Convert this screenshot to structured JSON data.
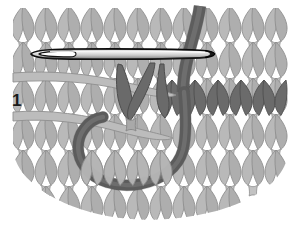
{
  "illustration": {
    "title": "Grafting with tapestry needle on stockinette knitting",
    "step_label": "1",
    "subject": "knitting-technique-diagram",
    "caption_text": "1"
  },
  "palette": {
    "background": "#ffffff",
    "fabric_light": "#b9b9b9",
    "fabric_light_shade": "#a8a8a8",
    "fabric_outline": "#8e8e8e",
    "fabric_highlight": "#cfcfcf",
    "yarn_dark": "#6b6b6b",
    "yarn_dark_shade": "#5c5c5c",
    "yarn_dark_outline": "#4a4a4a",
    "needle_body": "#d8d8d8",
    "needle_outline": "#111111",
    "label_color": "#1b1b1b"
  },
  "elements": {
    "knit_fabric_label": "knitted stockinette fabric",
    "needle_label": "tapestry needle",
    "dark_yarn_label": "contrast grafting yarn",
    "yarn_loop_label": "working yarn loop",
    "dark_stitch_row_label": "row of dark worked stitches"
  },
  "geometry": {
    "fabric_columns": 12,
    "fabric_rows": 7,
    "column_width": 24.5,
    "row_height": 26,
    "fabric_left": 13,
    "fabric_top": 8,
    "fabric_right": 288,
    "needle_x1": 30,
    "needle_x2": 213,
    "needle_y": 54,
    "needle_thickness": 7
  }
}
